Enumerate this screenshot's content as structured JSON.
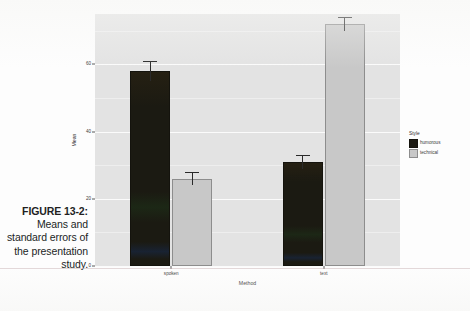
{
  "caption": {
    "figure_number": "FIGURE 13-2:",
    "text": "Means and standard errors of the presentation study."
  },
  "chart_data": {
    "type": "bar",
    "title": "",
    "xlabel": "Method",
    "ylabel": "Mean",
    "categories": [
      "spoken",
      "text"
    ],
    "series": [
      {
        "name": "humorous",
        "color": "#1b1a12",
        "values": [
          58,
          31
        ],
        "errors": [
          3,
          2
        ]
      },
      {
        "name": "technical",
        "color": "#c8c8c8",
        "values": [
          26,
          72
        ],
        "errors": [
          2,
          2
        ]
      }
    ],
    "ylim": [
      0,
      75
    ],
    "yticks": [
      0,
      20,
      40,
      60
    ],
    "ytick_labels": [
      "0",
      "20",
      "40",
      "60"
    ],
    "grid": true,
    "legend": {
      "title": "Style",
      "position": "right",
      "entries": [
        "humorous",
        "technical"
      ]
    },
    "panel_background": "#e3e3e3",
    "gridline_color": "#fbfbfb"
  }
}
